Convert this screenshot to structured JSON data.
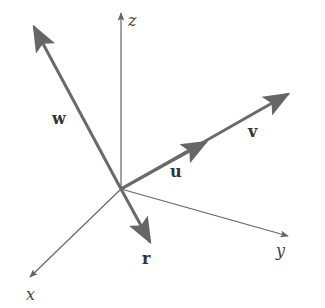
{
  "figure": {
    "colors": {
      "axis": "#666666",
      "vector": "#6a6a6a",
      "label": "#333333"
    },
    "axes": [
      {
        "name": "x",
        "label": "x"
      },
      {
        "name": "y",
        "label": "y"
      },
      {
        "name": "z",
        "label": "z"
      }
    ],
    "vectors": [
      {
        "name": "u",
        "label": "u"
      },
      {
        "name": "v",
        "label": "v"
      },
      {
        "name": "w",
        "label": "w"
      },
      {
        "name": "r",
        "label": "r"
      }
    ]
  }
}
